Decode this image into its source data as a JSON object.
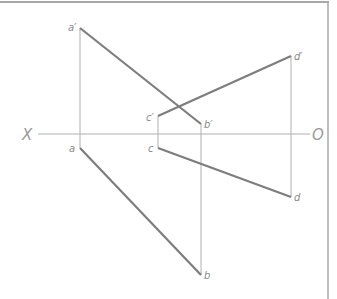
{
  "diagram": {
    "type": "orthographic-projection",
    "axis": {
      "left_label": "X",
      "right_label": "O",
      "y": 134,
      "x_start": 38,
      "x_end": 310
    },
    "colors": {
      "thick_line": "#7d7d7d",
      "thin_line": "#b0b0b0",
      "frame": "#a8a8a8",
      "label": "#8a8a8a"
    },
    "points": {
      "a_prime": {
        "label": "a′",
        "x": 80,
        "y": 28
      },
      "a": {
        "label": "a",
        "x": 80,
        "y": 148
      },
      "b_prime": {
        "label": "b′",
        "x": 201,
        "y": 124
      },
      "b": {
        "label": "b",
        "x": 201,
        "y": 275
      },
      "c_prime": {
        "label": "c′",
        "x": 158,
        "y": 116
      },
      "c": {
        "label": "c",
        "x": 158,
        "y": 148
      },
      "d_prime": {
        "label": "d′",
        "x": 291,
        "y": 56
      },
      "d": {
        "label": "d",
        "x": 291,
        "y": 197
      }
    },
    "segments_thick": [
      [
        "a_prime",
        "b_prime"
      ],
      [
        "a",
        "b"
      ],
      [
        "c_prime",
        "d_prime"
      ],
      [
        "c",
        "d"
      ]
    ],
    "projection_lines_thin": [
      [
        "a_prime",
        "a"
      ],
      [
        "b_prime",
        "b"
      ],
      [
        "c_prime",
        "c"
      ],
      [
        "d_prime",
        "d"
      ]
    ]
  }
}
